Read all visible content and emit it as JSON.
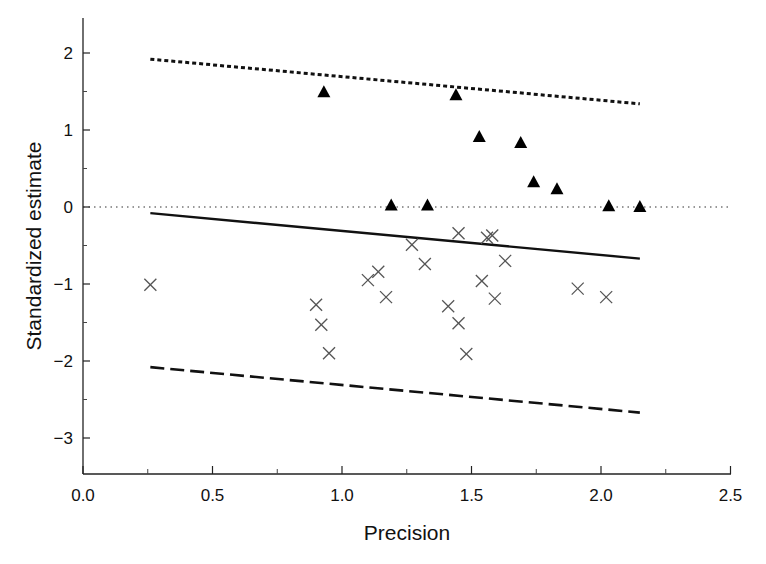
{
  "chart_data": {
    "type": "scatter",
    "title": "",
    "xlabel": "Precision",
    "ylabel": "Standardized estimate",
    "xlim": [
      0.0,
      2.5
    ],
    "ylim": [
      -3.45,
      2.45
    ],
    "x_ticks": [
      "0.0",
      "0.5",
      "1.0",
      "1.5",
      "2.0",
      "2.5"
    ],
    "x_tick_values": [
      0.0,
      0.5,
      1.0,
      1.5,
      2.0,
      2.5
    ],
    "y_ticks": [
      "2",
      "1",
      "0",
      "−1",
      "−2",
      "−3"
    ],
    "y_tick_values": [
      2,
      1,
      0,
      -1,
      -2,
      -3
    ],
    "grid": false,
    "legend": null,
    "series": [
      {
        "name": "triangles",
        "marker": "filled-triangle",
        "color": "#000000",
        "points": [
          {
            "x": 0.93,
            "y": 1.49
          },
          {
            "x": 1.44,
            "y": 1.45
          },
          {
            "x": 1.53,
            "y": 0.91
          },
          {
            "x": 1.69,
            "y": 0.83
          },
          {
            "x": 1.74,
            "y": 0.32
          },
          {
            "x": 1.83,
            "y": 0.23
          },
          {
            "x": 1.19,
            "y": 0.02
          },
          {
            "x": 1.33,
            "y": 0.02
          },
          {
            "x": 2.03,
            "y": 0.01
          },
          {
            "x": 2.15,
            "y": 0.0
          }
        ]
      },
      {
        "name": "crosses",
        "marker": "x",
        "color": "#555555",
        "points": [
          {
            "x": 0.26,
            "y": -1.01
          },
          {
            "x": 0.9,
            "y": -1.27
          },
          {
            "x": 0.92,
            "y": -1.53
          },
          {
            "x": 0.95,
            "y": -1.9
          },
          {
            "x": 1.1,
            "y": -0.95
          },
          {
            "x": 1.14,
            "y": -0.84
          },
          {
            "x": 1.17,
            "y": -1.17
          },
          {
            "x": 1.27,
            "y": -0.49
          },
          {
            "x": 1.32,
            "y": -0.74
          },
          {
            "x": 1.41,
            "y": -1.29
          },
          {
            "x": 1.45,
            "y": -0.34
          },
          {
            "x": 1.45,
            "y": -1.51
          },
          {
            "x": 1.48,
            "y": -1.91
          },
          {
            "x": 1.54,
            "y": -0.96
          },
          {
            "x": 1.56,
            "y": -0.4
          },
          {
            "x": 1.58,
            "y": -0.37
          },
          {
            "x": 1.59,
            "y": -1.19
          },
          {
            "x": 1.63,
            "y": -0.7
          },
          {
            "x": 1.91,
            "y": -1.06
          },
          {
            "x": 2.02,
            "y": -1.17
          }
        ]
      }
    ],
    "lines": [
      {
        "name": "upper-bound",
        "style": "dotted-thick",
        "x": [
          0.26,
          2.15
        ],
        "y": [
          1.92,
          1.34
        ]
      },
      {
        "name": "regression",
        "style": "solid",
        "x": [
          0.26,
          2.15
        ],
        "y": [
          -0.08,
          -0.67
        ]
      },
      {
        "name": "lower-bound",
        "style": "dashed",
        "x": [
          0.26,
          2.15
        ],
        "y": [
          -2.08,
          -2.67
        ]
      },
      {
        "name": "zero-reference",
        "style": "dotted-fine",
        "x": [
          0.0,
          2.5
        ],
        "y": [
          0,
          0
        ]
      }
    ]
  }
}
